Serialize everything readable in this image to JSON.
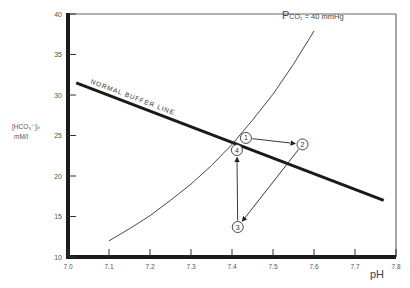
{
  "chart_data": {
    "type": "line",
    "title": "",
    "xlabel": "pH",
    "ylabel": "[HCO3-]P mM/l",
    "ylabel_line1": "[HCO₃⁻]ₚ",
    "ylabel_line2": "mM/l",
    "xlim": [
      7.0,
      7.8
    ],
    "ylim": [
      10,
      40
    ],
    "grid": false,
    "x_ticks": [
      "7.0",
      "7.1",
      "7.2",
      "7.3",
      "7.4",
      "7.5",
      "7.6",
      "7.7",
      "7.8"
    ],
    "y_ticks": [
      "10",
      "15",
      "20",
      "25",
      "30",
      "35",
      "40"
    ],
    "series": [
      {
        "name": "Normal Buffer Line",
        "label": "NORMAL  BUFFER  LINE",
        "style": "thick",
        "x": [
          7.02,
          7.77
        ],
        "y": [
          31.5,
          17.0
        ]
      },
      {
        "name": "PCO2 = 40 mmHg isobar",
        "label_prefix": "P",
        "label_sub": "CO₂",
        "label_suffix": " = 40 mmHg",
        "style": "thin",
        "x": [
          7.1,
          7.15,
          7.2,
          7.25,
          7.3,
          7.35,
          7.4,
          7.45,
          7.5,
          7.55,
          7.6
        ],
        "y": [
          12.0,
          13.5,
          15.1,
          17.0,
          19.0,
          21.3,
          23.9,
          26.9,
          30.1,
          33.8,
          37.9
        ]
      }
    ],
    "points": [
      {
        "label": "1",
        "x": 7.434,
        "y": 24.7
      },
      {
        "label": "2",
        "x": 7.572,
        "y": 23.9
      },
      {
        "label": "3",
        "x": 7.414,
        "y": 13.7
      },
      {
        "label": "4",
        "x": 7.412,
        "y": 23.2
      }
    ],
    "arrows": [
      {
        "from": "1",
        "to": "2"
      },
      {
        "from": "2",
        "to": "3"
      },
      {
        "from": "3",
        "to": "4"
      }
    ]
  },
  "labels": {
    "pco2_prefix": "P",
    "pco2_sub": "CO₂",
    "pco2_suffix": " = 40 mmHg",
    "xlabel": "pH",
    "ylabel_line1": "[HCO₃⁻]ₚ",
    "ylabel_line2": "mM/l"
  }
}
